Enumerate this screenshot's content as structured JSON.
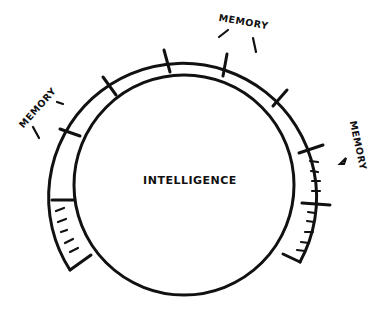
{
  "diagram": {
    "type": "concept-diagram",
    "center_label": "INTELLIGENCE",
    "ring_label_top": "MEMORY",
    "ring_label_left": "MEMORY",
    "ring_label_right": "MEMORY",
    "colors": {
      "ink": "#111111",
      "background": "#ffffff"
    },
    "structure": {
      "inner_circle": "Intelligence (core circle)",
      "outer_ring": "Memory (segmented arc of cells surrounding intelligence)",
      "ring_segments": 9,
      "filled_segments": "lower-left and lower-right end cells contain tick marks"
    }
  }
}
